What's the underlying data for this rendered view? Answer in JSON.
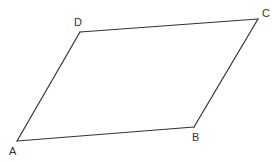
{
  "diagram": {
    "type": "parallelogram",
    "stroke_color": "#333333",
    "background": "#ffffff",
    "vertices": [
      {
        "name": "A",
        "x": 17,
        "y": 141,
        "label_x": 9,
        "label_y": 155
      },
      {
        "name": "B",
        "x": 194,
        "y": 127,
        "label_x": 192,
        "label_y": 141
      },
      {
        "name": "C",
        "x": 258,
        "y": 19,
        "label_x": 262,
        "label_y": 17
      },
      {
        "name": "D",
        "x": 80,
        "y": 32,
        "label_x": 74,
        "label_y": 26
      }
    ],
    "labels": {
      "A": "A",
      "B": "B",
      "C": "C",
      "D": "D"
    },
    "edges": [
      [
        "A",
        "B"
      ],
      [
        "B",
        "C"
      ],
      [
        "C",
        "D"
      ],
      [
        "D",
        "A"
      ]
    ]
  }
}
